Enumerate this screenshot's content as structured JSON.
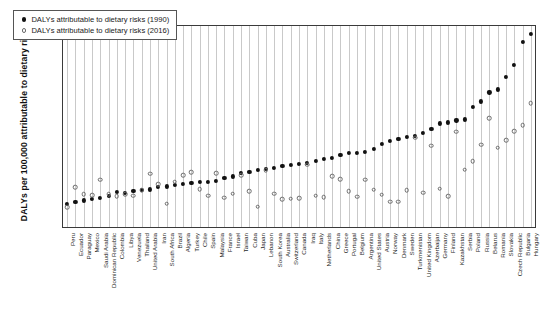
{
  "chart_data": {
    "type": "scatter",
    "title": "",
    "xlabel": "",
    "ylabel": "DALYs per 100,000 attributable to dietary risks",
    "ylim": [
      0,
      10000
    ],
    "yticks": [
      0,
      2000,
      4000,
      6000,
      8000,
      10000
    ],
    "grid": "vertical",
    "legend_position": "top-left",
    "legend": [
      "DALYs attributable to dietary risks (1990)",
      "DALYs attributable to dietary risks (2016)"
    ],
    "categories": [
      "Peru",
      "Ecuador",
      "Paraguay",
      "Mexico",
      "Saudi Arabia",
      "Dominican Republic",
      "Colombia",
      "Libya",
      "Venezuela",
      "Thailand",
      "United Arabia",
      "Iran",
      "South Africa",
      "Brazil",
      "Algeria",
      "Turkey",
      "Chile",
      "Spain",
      "Malaysia",
      "France",
      "Israel",
      "Taiwan",
      "Cuba",
      "Japan",
      "Lebanon",
      "South Korea",
      "Australia",
      "Switzerland",
      "Canada",
      "Iraq",
      "Italy",
      "Netherlands",
      "China",
      "Greece",
      "Portugal",
      "Belgium",
      "Argentina",
      "United States",
      "Austria",
      "Norway",
      "Denmark",
      "Sweden",
      "Turkmenistan",
      "United Kingdom",
      "Azerbaijan",
      "Germany",
      "Finland",
      "Kazakhstan",
      "Serbia",
      "Poland",
      "Russia",
      "Belarus",
      "Romania",
      "Slovakia",
      "Czech Republic",
      "Bulgaria",
      "Hungary"
    ],
    "series": [
      {
        "name": "DALYs attributable to dietary risks (1990)",
        "marker": "filled-circle",
        "color": "#111111",
        "values": [
          1150,
          1260,
          1320,
          1380,
          1450,
          1550,
          1750,
          1700,
          1780,
          1860,
          1870,
          1990,
          2020,
          2080,
          2150,
          2180,
          2230,
          2260,
          2300,
          2450,
          2520,
          2680,
          2760,
          2830,
          2880,
          2960,
          3020,
          3080,
          3130,
          3180,
          3300,
          3390,
          3450,
          3600,
          3680,
          3700,
          3750,
          3900,
          4120,
          4300,
          4380,
          4480,
          4520,
          4700,
          4900,
          5150,
          5200,
          5300,
          5350,
          5980,
          6250,
          6700,
          6850,
          7450,
          8050,
          9200,
          9600
        ]
      },
      {
        "name": "DALYs attributable to dietary risks (2016)",
        "marker": "open-circle",
        "color": "#6b6b6b",
        "values": [
          980,
          1980,
          1640,
          1580,
          2360,
          1620,
          1540,
          1620,
          1550,
          1840,
          2660,
          2120,
          1150,
          2260,
          2590,
          2720,
          1880,
          1550,
          2680,
          1450,
          1650,
          2580,
          1780,
          1000,
          2820,
          1650,
          1380,
          1400,
          1420,
          3100,
          1560,
          1480,
          2530,
          2380,
          1790,
          1500,
          2350,
          1850,
          1600,
          1260,
          1250,
          1830,
          4450,
          1700,
          4050,
          1900,
          1530,
          4750,
          2860,
          3270,
          4100,
          5400,
          3950,
          4330,
          4780,
          5050,
          6150
        ]
      }
    ]
  },
  "axis": {
    "y_title": "DALYs per 100,000 attributable to dietary risks"
  }
}
